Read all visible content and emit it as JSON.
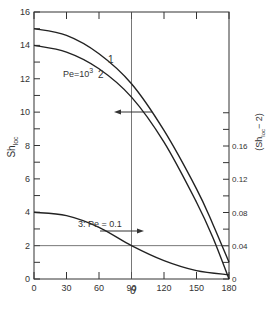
{
  "chart_data": {
    "type": "line",
    "title": "",
    "xlabel": "θ",
    "ylabel": "Sh_loc",
    "ylabel_right": "(Sh_loc − 2)",
    "xlim": [
      0,
      180
    ],
    "ylim": [
      0,
      16
    ],
    "ylim_right": [
      0,
      0.19
    ],
    "x_ticks": [
      0,
      30,
      60,
      90,
      120,
      150,
      180
    ],
    "y_ticks": [
      0,
      2,
      4,
      6,
      8,
      10,
      12,
      14,
      16
    ],
    "y_ticks_right": [
      0,
      0.04,
      0.08,
      0.12,
      0.16
    ],
    "grid": false,
    "reference_lines": [
      {
        "orientation": "vertical",
        "x": 90
      },
      {
        "orientation": "horizontal",
        "y": 2
      }
    ],
    "annotations": [
      {
        "text": "1",
        "at": [
          100,
          12.3
        ]
      },
      {
        "text": "2",
        "at": [
          93,
          11.2
        ]
      },
      {
        "text": "Pe=10³",
        "at": [
          55,
          11.8
        ]
      },
      {
        "text": "3: Pe = 0.1",
        "at": [
          70,
          3.4
        ]
      },
      {
        "text": "←",
        "meaning": "curves 1 and 2 read on left axis",
        "at": [
          110,
          9.9
        ]
      },
      {
        "text": "→",
        "meaning": "curve 3 read on right axis",
        "at": [
          95,
          2.9
        ]
      }
    ],
    "series": [
      {
        "name": "1",
        "axis": "left",
        "x": [
          0,
          30,
          60,
          90,
          120,
          150,
          165,
          180
        ],
        "values": [
          15.0,
          14.6,
          13.5,
          11.7,
          8.9,
          5.4,
          3.3,
          1.0
        ]
      },
      {
        "name": "2 (Pe=10³)",
        "axis": "left",
        "x": [
          0,
          30,
          60,
          90,
          120,
          150,
          165,
          180
        ],
        "values": [
          14.0,
          13.6,
          12.6,
          10.9,
          8.2,
          4.6,
          2.5,
          0.0
        ]
      },
      {
        "name": "3: Pe = 0.1",
        "axis": "left",
        "x": [
          0,
          30,
          60,
          90,
          120,
          150,
          180
        ],
        "values": [
          4.0,
          3.8,
          3.1,
          2.0,
          1.1,
          0.5,
          0.25
        ]
      }
    ]
  },
  "labels": {
    "ylabel": "Sh",
    "ylabel_sub": "loc",
    "ylabel_right_pre": "(Sh",
    "ylabel_right_sub": "loc",
    "ylabel_right_post": "− 2)",
    "xlabel": "θ",
    "curve1": "1",
    "curve2": "2",
    "pe_high": "Pe=10",
    "pe_high_exp": "3",
    "curve3": "3: Pe = 0.1"
  }
}
